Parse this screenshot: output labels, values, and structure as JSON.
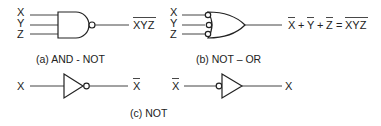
{
  "diagram": {
    "background": "#ffffff",
    "line_color": "#222222",
    "gates": [
      {
        "id": "a",
        "type": "NAND",
        "inputs": [
          "X",
          "Y",
          "Z"
        ],
        "output_label": "XYZ",
        "output_overlined": true,
        "caption": "(a) AND - NOT"
      },
      {
        "id": "b",
        "type": "OR with inverted inputs",
        "inputs": [
          "X",
          "Y",
          "Z"
        ],
        "output_expression": {
          "terms": [
            "X",
            "Y",
            "Z"
          ],
          "plus": "+",
          "equals": "=",
          "rhs": "XYZ"
        },
        "caption": "(b) NOT – OR"
      },
      {
        "id": "c1",
        "type": "NOT (output bubble)",
        "input": "X",
        "output": "X",
        "output_overlined": true
      },
      {
        "id": "c2",
        "type": "NOT (input bubble)",
        "input": "X",
        "input_overlined": true,
        "output": "X"
      }
    ],
    "caption_c": "(c) NOT"
  }
}
